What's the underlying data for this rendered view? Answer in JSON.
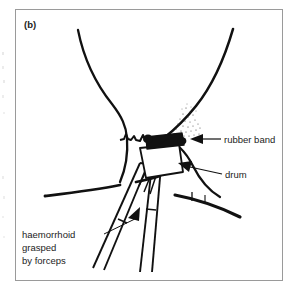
{
  "figure": {
    "panel_label": "(b)",
    "frame_color": "#9a9a9a",
    "background_color": "#ffffff",
    "ink_color": "#111111",
    "stipple_color": "#3a3a3a"
  },
  "callouts": {
    "rubber_band": {
      "label": "rubber band",
      "icon": "arrow-left-icon"
    },
    "drum": {
      "label": "drum",
      "icon": "leader-line-icon"
    },
    "haemorrhoid": {
      "line1": "haemorrhoid",
      "line2": "grasped",
      "line3": "by forceps",
      "icon": "arrow-up-right-icon"
    }
  },
  "anatomy": {
    "left_buttock": "left-buttock-contour",
    "right_buttock": "right-buttock-contour",
    "dentate_line": "wavy-dentate-line",
    "left_skin_line": "left-perianal-skin-line",
    "right_skin_line": "right-perianal-skin-line",
    "mucosa_stipple": "stippled-mucosa-patch"
  },
  "instrument": {
    "drum_body": "banding-drum",
    "band": "rubber-band-ring",
    "forceps_left": "forceps-arm-left",
    "forceps_right": "forceps-arm-right",
    "grasped_tissue": "grasped-haemorrhoid-tissue"
  }
}
